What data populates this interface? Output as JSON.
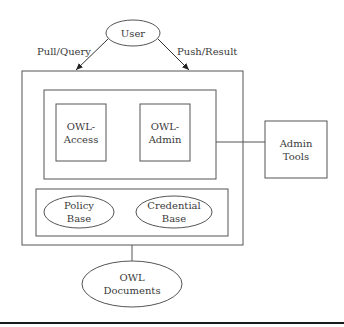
{
  "diagram": {
    "user": {
      "label": "User"
    },
    "edges": {
      "pull": {
        "label": "Pull/Query"
      },
      "push": {
        "label": "Push/Result"
      }
    },
    "modules": {
      "access": {
        "line1": "OWL-",
        "line2": "Access"
      },
      "admin": {
        "line1": "OWL-",
        "line2": "Admin"
      }
    },
    "admin_tools": {
      "line1": "Admin",
      "line2": "Tools"
    },
    "bases": {
      "policy": {
        "line1": "Policy",
        "line2": "Base"
      },
      "credential": {
        "line1": "Credential",
        "line2": "Base"
      }
    },
    "documents": {
      "line1": "OWL",
      "line2": "Documents"
    }
  },
  "colors": {
    "stroke": "#555555",
    "text": "#3a3a3a",
    "rule": "#1a1a1a"
  }
}
